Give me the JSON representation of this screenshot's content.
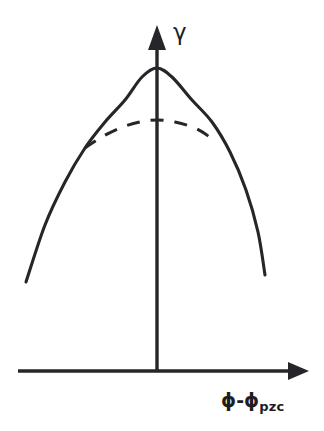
{
  "figure": {
    "kind": "line-diagram",
    "background_color": "#ffffff",
    "ink_color": "#26262a"
  },
  "axes": {
    "y_label": "γ",
    "y_label_name": "interfacial-tension",
    "x_label_prefix": "ϕ-ϕ",
    "x_label_subscript": "pzc",
    "x_axis_name": "potential-relative-to-pzc",
    "arrows": "both-axes-arrowheads",
    "tick_marks": "none",
    "tick_labels": "none",
    "grid": "off"
  },
  "chart_data": {
    "type": "line",
    "title": "",
    "subtitle": "",
    "xlabel": "ϕ-ϕpzc",
    "ylabel": "γ",
    "xlim": [
      -1.0,
      1.0
    ],
    "ylim": [
      0,
      1.0
    ],
    "grid": false,
    "legend": "none",
    "annotations": [],
    "axis_origin_px": [
      157,
      371
    ],
    "series": [
      {
        "name": "electrocapillary-curve-solid",
        "style": "solid",
        "color": "#26262a",
        "comment": "full parabola, maximum at the point of zero charge",
        "x": [
          -1.0,
          -0.85,
          -0.7,
          -0.55,
          -0.4,
          -0.25,
          -0.1,
          0.0,
          0.1,
          0.25,
          0.4,
          0.55,
          0.7,
          0.85,
          1.0
        ],
        "y": [
          0.295,
          0.472,
          0.617,
          0.733,
          0.824,
          0.893,
          0.939,
          0.95,
          0.939,
          0.893,
          0.824,
          0.733,
          0.617,
          0.472,
          0.33
        ],
        "px_points": [
          [
            26,
            282
          ],
          [
            45,
            225
          ],
          [
            65,
            182
          ],
          [
            85,
            148
          ],
          [
            105,
            122
          ],
          [
            125,
            100
          ],
          [
            142,
            77
          ],
          [
            157,
            68
          ],
          [
            172,
            77
          ],
          [
            192,
            100
          ],
          [
            212,
            122
          ],
          [
            230,
            152
          ],
          [
            246,
            190
          ],
          [
            258,
            232
          ],
          [
            265,
            275
          ]
        ]
      },
      {
        "name": "electrocapillary-curve-dashed",
        "style": "dashed",
        "color": "#26262a",
        "comment": "flattened branch with specific adsorption, lower and broader maximum, merges with the solid curve at both ends",
        "x": [
          -0.55,
          -0.45,
          -0.3,
          -0.15,
          0.0,
          0.15,
          0.3,
          0.4
        ],
        "y": [
          0.733,
          0.76,
          0.784,
          0.795,
          0.8,
          0.795,
          0.781,
          0.76
        ],
        "px_points": [
          [
            85,
            148
          ],
          [
            100,
            138
          ],
          [
            120,
            128
          ],
          [
            140,
            122
          ],
          [
            157,
            120
          ],
          [
            175,
            122
          ],
          [
            197,
            129
          ],
          [
            215,
            141
          ]
        ]
      }
    ]
  }
}
